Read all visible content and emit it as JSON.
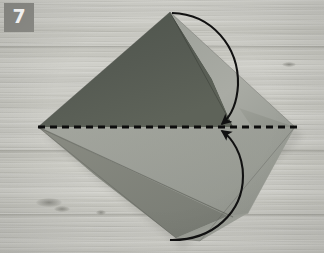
{
  "photo": {
    "width": 324,
    "height": 253,
    "subject": "origami-fold-step",
    "background": {
      "material": "wood-surface",
      "base_color": "#c8c8c2",
      "grain_color": "#96968f"
    },
    "step_badge": {
      "number": "7",
      "background_color": "#8d8d88",
      "text_color": "#ffffff",
      "x": 4,
      "y": 3,
      "width": 30,
      "height": 29
    },
    "paper": {
      "shape": "kite-diamond",
      "corners": {
        "top": {
          "x": 170,
          "y": 12
        },
        "left": {
          "x": 38,
          "y": 127
        },
        "right": {
          "x": 295,
          "y": 127
        },
        "bottom": {
          "x": 176,
          "y": 238
        }
      },
      "colors": {
        "dark_gray": "#555a52",
        "mid_gray": "#8d8f88",
        "light_gray": "#a8aaa3",
        "pale_gray": "#b3b5ae",
        "shadow_gray": "#7a7d76"
      }
    },
    "annotations": {
      "crease_line": {
        "type": "dashed-fold-line",
        "color": "#0d0d0d",
        "x1": 38,
        "y1": 127,
        "x2": 298,
        "y2": 127,
        "dash": "7 5",
        "width": 3.2
      },
      "arrows": [
        {
          "name": "fold-top-point-down",
          "direction": "down",
          "color": "#111111",
          "start": {
            "x": 172,
            "y": 13
          },
          "end": {
            "x": 221,
            "y": 124
          }
        },
        {
          "name": "fold-bottom-point-up",
          "direction": "up",
          "color": "#111111",
          "start": {
            "x": 170,
            "y": 240
          },
          "end": {
            "x": 221,
            "y": 131
          }
        }
      ]
    }
  }
}
